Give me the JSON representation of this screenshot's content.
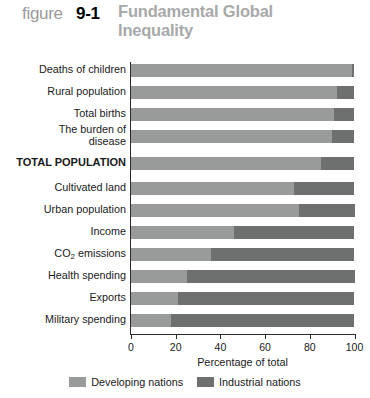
{
  "header": {
    "figure_word": "figure",
    "figure_number": "9-1",
    "title": "Fundamental Global Inequality"
  },
  "legend": {
    "items": [
      {
        "label": "Developing nations",
        "color": "#999a9a"
      },
      {
        "label": "Industrial nations",
        "color": "#6e6f6f"
      }
    ]
  },
  "axis": {
    "x_title": "Percentage of total",
    "ticks": [
      "0",
      "20",
      "40",
      "60",
      "80",
      "100"
    ]
  },
  "chart_data": {
    "type": "bar",
    "orientation": "horizontal",
    "stacked": true,
    "stacked_total": 100,
    "title": "Fundamental Global Inequality",
    "xlabel": "Percentage of total",
    "ylabel": "",
    "xlim": [
      0,
      100
    ],
    "xticks": [
      0,
      20,
      40,
      60,
      80,
      100
    ],
    "grid": false,
    "legend_position": "bottom",
    "categories": [
      "Deaths of children",
      "Rural population",
      "Total births",
      "The burden of disease",
      "TOTAL POPULATION",
      "Cultivated land",
      "Urban population",
      "Income",
      "CO2 emissions",
      "Health spending",
      "Exports",
      "Military spending"
    ],
    "series": [
      {
        "name": "Developing nations",
        "color": "#999a9a",
        "values": [
          99,
          92,
          91,
          90,
          85,
          73,
          75,
          46,
          36,
          25,
          21,
          18
        ]
      },
      {
        "name": "Industrial nations",
        "color": "#6e6f6f",
        "values": [
          1,
          8,
          9,
          10,
          15,
          27,
          25,
          54,
          64,
          75,
          79,
          82
        ]
      }
    ]
  }
}
